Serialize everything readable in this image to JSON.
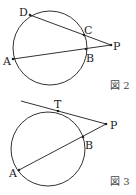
{
  "figures": [
    {
      "caption": "図 2",
      "points": {
        "D": "D",
        "C": "C",
        "P": "P",
        "A": "A",
        "B": "B"
      },
      "description": "Two secants PD and PA from external point P intersecting the circle at C, D and B, A"
    },
    {
      "caption": "図 3",
      "points": {
        "T": "T",
        "P": "P",
        "B": "B",
        "A": "A"
      },
      "description": "Tangent PT and secant PA from external point P; the secant intersects the circle at B and A"
    }
  ],
  "colors": {
    "stroke": "#333333",
    "background": "#ffffff"
  }
}
